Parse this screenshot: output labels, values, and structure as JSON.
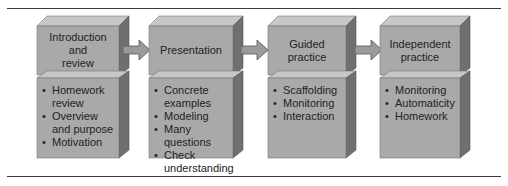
{
  "diagram": {
    "type": "process-flow",
    "colors": {
      "front": "#a9a9a9",
      "top": "#c7c7c7",
      "side": "#6f6f6f",
      "arrow": "#9a9a9a",
      "rule": "#3a3a3a",
      "text": "#222222"
    },
    "stages": [
      {
        "title": "Introduction\nand\nreview",
        "items": [
          "Homework review",
          "Overview and purpose",
          "Motivation"
        ]
      },
      {
        "title": "Presentation",
        "items": [
          "Concrete examples",
          "Modeling",
          "Many questions",
          "Check understanding"
        ]
      },
      {
        "title": "Guided\npractice",
        "items": [
          "Scaffolding",
          "Monitoring",
          "Interaction"
        ]
      },
      {
        "title": "Independent\npractice",
        "items": [
          "Monitoring",
          "Automaticity",
          "Homework"
        ]
      }
    ],
    "arrows": [
      {
        "from": 0,
        "to": 1,
        "icon": "arrow-right-icon"
      },
      {
        "from": 1,
        "to": 2,
        "icon": "arrow-right-icon"
      },
      {
        "from": 2,
        "to": 3,
        "icon": "arrow-right-icon"
      }
    ]
  }
}
